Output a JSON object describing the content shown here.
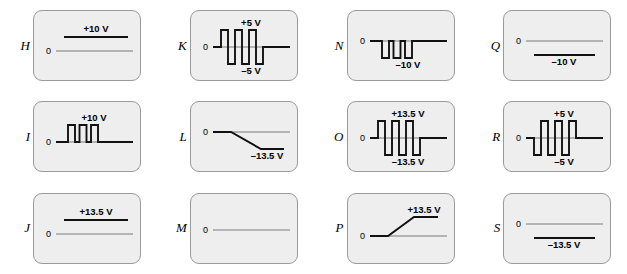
{
  "figure": {
    "background": "#ffffff",
    "panel_fill": "#eeeeee",
    "panel_border": "#9a9a9a",
    "trace_color": "#111111",
    "axis_color": "#7b7b7b",
    "zero_label": "0",
    "columns": 4,
    "rows": 3
  },
  "panels": [
    {
      "id": "H",
      "label": "H",
      "zero": "0",
      "waveform": "dc-level-above",
      "top_label": "+10 V",
      "bottom_label": "",
      "levels": {
        "high": "+10 V",
        "low": ""
      },
      "description": "steady DC level at +10 V above the zero line"
    },
    {
      "id": "K",
      "label": "K",
      "zero": "0",
      "waveform": "square-bipolar-positive-first",
      "top_label": "+5 V",
      "bottom_label": "–5 V",
      "levels": {
        "high": "+5 V",
        "low": "–5 V"
      },
      "description": "bipolar square wave swinging between +5 V and -5 V, first excursion positive"
    },
    {
      "id": "N",
      "label": "N",
      "zero": "0",
      "waveform": "pulses-negative",
      "top_label": "",
      "bottom_label": "–10 V",
      "levels": {
        "high": "",
        "low": "–10 V"
      },
      "description": "negative-going rectangular pulses from 0 down to -10 V"
    },
    {
      "id": "Q",
      "label": "Q",
      "zero": "0",
      "waveform": "dc-level-below",
      "top_label": "",
      "bottom_label": "–10 V",
      "levels": {
        "high": "",
        "low": "–10 V"
      },
      "description": "steady DC level at -10 V below the zero line"
    },
    {
      "id": "I",
      "label": "I",
      "zero": "0",
      "waveform": "pulses-positive",
      "top_label": "+10 V",
      "bottom_label": "",
      "levels": {
        "high": "+10 V",
        "low": ""
      },
      "description": "positive-going rectangular pulses from 0 up to +10 V"
    },
    {
      "id": "L",
      "label": "L",
      "zero": "0",
      "waveform": "ramp-down",
      "top_label": "",
      "bottom_label": "–13.5 V",
      "levels": {
        "high": "",
        "low": "–13.5 V"
      },
      "description": "flat at 0, then ramps down to -13.5 V and holds"
    },
    {
      "id": "O",
      "label": "O",
      "zero": "0",
      "waveform": "square-bipolar-positive-first",
      "top_label": "+13.5 V",
      "bottom_label": "–13.5 V",
      "levels": {
        "high": "+13.5 V",
        "low": "–13.5 V"
      },
      "description": "bipolar square wave swinging between +13.5 V and -13.5 V, first excursion positive"
    },
    {
      "id": "R",
      "label": "R",
      "zero": "0",
      "waveform": "square-bipolar-negative-first",
      "top_label": "+5 V",
      "bottom_label": "–5 V",
      "levels": {
        "high": "+5 V",
        "low": "–5 V"
      },
      "description": "bipolar square wave swinging between +5 V and -5 V, first excursion negative"
    },
    {
      "id": "J",
      "label": "J",
      "zero": "0",
      "waveform": "dc-level-above",
      "top_label": "+13.5 V",
      "bottom_label": "",
      "levels": {
        "high": "+13.5 V",
        "low": ""
      },
      "description": "steady DC level at +13.5 V above the zero line"
    },
    {
      "id": "M",
      "label": "M",
      "zero": "0",
      "waveform": "zero-only",
      "top_label": "",
      "bottom_label": "",
      "levels": {
        "high": "",
        "low": ""
      },
      "description": "zero line only, no signal"
    },
    {
      "id": "P",
      "label": "P",
      "zero": "0",
      "waveform": "ramp-up",
      "top_label": "+13.5 V",
      "bottom_label": "",
      "levels": {
        "high": "+13.5 V",
        "low": ""
      },
      "description": "flat at 0, then ramps up to +13.5 V and holds"
    },
    {
      "id": "S",
      "label": "S",
      "zero": "0",
      "waveform": "dc-level-below",
      "top_label": "",
      "bottom_label": "–13.5 V",
      "levels": {
        "high": "",
        "low": "–13.5 V"
      },
      "description": "steady DC level at -13.5 V below the zero line"
    }
  ]
}
